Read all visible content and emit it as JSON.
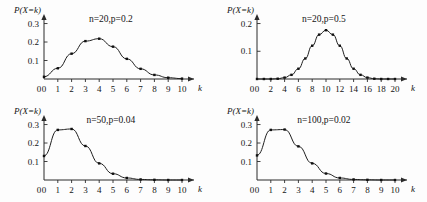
{
  "figure": {
    "background": "#fdfdfd",
    "ink_color": "#1a1a1a",
    "marker_color": "#111111"
  },
  "chart_data": [
    {
      "type": "line",
      "title": "n=20,p=0.2",
      "xlabel": "k",
      "ylabel": "P(X=k)",
      "x": [
        0,
        1,
        2,
        3,
        4,
        5,
        6,
        7,
        8,
        9,
        10
      ],
      "values": [
        0.012,
        0.058,
        0.137,
        0.205,
        0.218,
        0.175,
        0.109,
        0.055,
        0.022,
        0.007,
        0.002
      ],
      "xticks": [
        0,
        1,
        2,
        3,
        4,
        5,
        6,
        7,
        8,
        9,
        10
      ],
      "xticklabels": [
        "0",
        "1",
        "2",
        "3",
        "4",
        "5",
        "6",
        "7",
        "8",
        "9",
        "10"
      ],
      "yticks": [
        0.1,
        0.2,
        0.3
      ],
      "yticklabels": [
        "0.1",
        "0.2",
        "0.3"
      ],
      "xlim": [
        0,
        10
      ],
      "ylim": [
        0,
        0.33
      ],
      "grid": false,
      "legend": "none",
      "markers": "filled-square"
    },
    {
      "type": "line",
      "title": "n=20,p=0.5",
      "xlabel": "k",
      "ylabel": "P(X=k)",
      "x": [
        0,
        1,
        2,
        3,
        4,
        5,
        6,
        7,
        8,
        9,
        10,
        11,
        12,
        13,
        14,
        15,
        16,
        17,
        18,
        19,
        20
      ],
      "values": [
        0.0,
        0.0,
        0.0,
        0.001,
        0.005,
        0.015,
        0.037,
        0.074,
        0.12,
        0.16,
        0.176,
        0.16,
        0.12,
        0.074,
        0.037,
        0.015,
        0.005,
        0.001,
        0.0,
        0.0,
        0.0
      ],
      "xticks": [
        0,
        2,
        4,
        6,
        8,
        10,
        12,
        14,
        16,
        18,
        20
      ],
      "xticklabels": [
        "0",
        "2",
        "4",
        "6",
        "8",
        "10",
        "12",
        "14",
        "16",
        "18",
        "20"
      ],
      "yticks": [
        0.1,
        0.2
      ],
      "yticklabels": [
        "0.1",
        "0.2"
      ],
      "xlim": [
        0,
        20
      ],
      "ylim": [
        0,
        0.22
      ],
      "grid": false,
      "legend": "none",
      "markers": "filled-square"
    },
    {
      "type": "line",
      "title": "n=50,p=0.04",
      "xlabel": "k",
      "ylabel": "P(X=k)",
      "x": [
        0,
        1,
        2,
        3,
        4,
        5,
        6,
        7,
        8,
        9,
        10
      ],
      "values": [
        0.13,
        0.271,
        0.276,
        0.184,
        0.09,
        0.034,
        0.011,
        0.003,
        0.001,
        0.0,
        0.0
      ],
      "xticks": [
        0,
        1,
        2,
        3,
        4,
        5,
        6,
        7,
        8,
        9,
        10
      ],
      "xticklabels": [
        "0",
        "1",
        "2",
        "3",
        "4",
        "5",
        "6",
        "7",
        "8",
        "9",
        "10"
      ],
      "yticks": [
        0.1,
        0.2,
        0.3
      ],
      "yticklabels": [
        "0.1",
        "0.2",
        "0.3"
      ],
      "xlim": [
        0,
        10
      ],
      "ylim": [
        0,
        0.33
      ],
      "grid": false,
      "legend": "none",
      "markers": "filled-square"
    },
    {
      "type": "line",
      "title": "n=100,p=0.02",
      "xlabel": "k",
      "ylabel": "P(X=k)",
      "x": [
        0,
        1,
        2,
        3,
        4,
        5,
        6,
        7,
        8,
        9,
        10
      ],
      "values": [
        0.133,
        0.271,
        0.273,
        0.182,
        0.09,
        0.035,
        0.011,
        0.003,
        0.001,
        0.0,
        0.0
      ],
      "xticks": [
        0,
        1,
        2,
        3,
        4,
        5,
        6,
        7,
        8,
        9,
        10
      ],
      "xticklabels": [
        "0",
        "1",
        "2",
        "3",
        "4",
        "5",
        "6",
        "7",
        "8",
        "9",
        "10"
      ],
      "yticks": [
        0.1,
        0.2,
        0.3
      ],
      "yticklabels": [
        "0.1",
        "0.2",
        "0.3"
      ],
      "xlim": [
        0,
        10
      ],
      "ylim": [
        0,
        0.33
      ],
      "grid": false,
      "legend": "none",
      "markers": "filled-square"
    }
  ]
}
